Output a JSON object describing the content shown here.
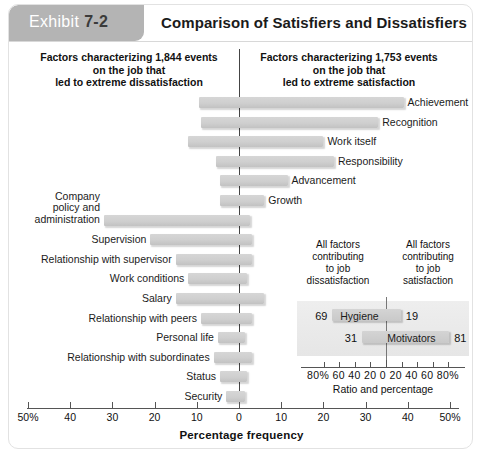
{
  "header": {
    "exhibit_label": "Exhibit",
    "exhibit_number": "7-2",
    "title": "Comparison of Satisfiers and Dissatisfiers"
  },
  "columns": {
    "left": "Factors characterizing 1,844 events\non the job that\nled to extreme dissatisfaction",
    "right": "Factors characterizing 1,753 events\non the job that\nled to extreme satisfaction"
  },
  "chart_data": {
    "type": "bar",
    "title": "Comparison of Satisfiers and Dissatisfiers",
    "xlabel": "Percentage frequency",
    "ylabel": "",
    "xlim": [
      -50,
      50
    ],
    "xticks": [
      -50,
      -40,
      -30,
      -20,
      -10,
      0,
      10,
      20,
      30,
      40,
      50
    ],
    "xticklabels": [
      "50%",
      "40",
      "30",
      "20",
      "10",
      "0",
      "10",
      "20",
      "30",
      "40",
      "50%"
    ],
    "grid": false,
    "orientation": "horizontal-diverging",
    "note": "Negative = dissatisfaction side (left), positive = satisfaction side (right)",
    "bars": [
      {
        "label": "Achievement",
        "left": -9.5,
        "right": 39.0,
        "side": "right"
      },
      {
        "label": "Recognition",
        "left": -9.0,
        "right": 33.0,
        "side": "right"
      },
      {
        "label": "Work itself",
        "left": -12.0,
        "right": 20.0,
        "side": "right"
      },
      {
        "label": "Responsibility",
        "left": -5.5,
        "right": 22.5,
        "side": "right"
      },
      {
        "label": "Advancement",
        "left": -4.5,
        "right": 11.5,
        "side": "right"
      },
      {
        "label": "Growth",
        "left": -4.5,
        "right": 6.0,
        "side": "right"
      },
      {
        "label": "Company\npolicy and\nadministration",
        "left": -32.0,
        "right": 2.5,
        "side": "left"
      },
      {
        "label": "Supervision",
        "left": -21.0,
        "right": 3.0,
        "side": "left"
      },
      {
        "label": "Relationship with supervisor",
        "left": -15.0,
        "right": 3.0,
        "side": "left"
      },
      {
        "label": "Work conditions",
        "left": -12.0,
        "right": 2.0,
        "side": "left"
      },
      {
        "label": "Salary",
        "left": -15.0,
        "right": 6.0,
        "side": "left"
      },
      {
        "label": "Relationship with peers",
        "left": -9.0,
        "right": 3.0,
        "side": "left"
      },
      {
        "label": "Personal life",
        "left": -5.0,
        "right": 1.5,
        "side": "left"
      },
      {
        "label": "Relationship with subordinates",
        "left": -6.0,
        "right": 3.0,
        "side": "left"
      },
      {
        "label": "Status",
        "left": -4.5,
        "right": 2.0,
        "side": "left"
      },
      {
        "label": "Security",
        "left": -3.0,
        "right": 1.5,
        "side": "left"
      }
    ]
  },
  "inset": {
    "head_left": "All factors\ncontributing\nto job\ndissatisfaction",
    "head_right": "All factors\ncontributing\nto job\nsatisfaction",
    "xlabels": "80% 60 40 20  0  20 40 60 80%",
    "xtitle": "Ratio and percentage",
    "rows": [
      {
        "name": "Hygiene",
        "left_value": "69",
        "right_value": "19",
        "left": 69,
        "right": 19
      },
      {
        "name": "Motivators",
        "left_value": "31",
        "right_value": "81",
        "left": 31,
        "right": 81
      }
    ]
  }
}
